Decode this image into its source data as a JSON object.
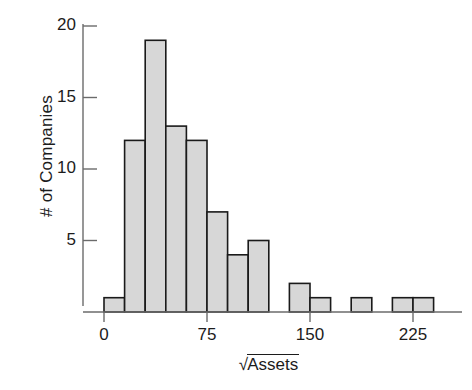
{
  "chart_data": {
    "type": "bar",
    "title": "",
    "subtitle": "",
    "xlabel": "√Assets",
    "xlabel_parts": {
      "radical": "√",
      "radicand": "Assets"
    },
    "ylabel": "# of Companies",
    "xlim": [
      -7.5,
      247.5
    ],
    "ylim": [
      0,
      21
    ],
    "xticks": [
      0,
      75,
      150,
      225
    ],
    "xtick_labels": [
      "0",
      "75",
      "150",
      "225"
    ],
    "yticks": [
      5,
      10,
      15,
      20
    ],
    "ytick_labels": [
      "5",
      "10",
      "15",
      "20"
    ],
    "grid": false,
    "legend": null,
    "bin_width": 15,
    "bin_edges": [
      0,
      15,
      30,
      45,
      60,
      75,
      90,
      105,
      120,
      135,
      150,
      165,
      180,
      195,
      210,
      225,
      240
    ],
    "categories": [
      "0-15",
      "15-30",
      "30-45",
      "45-60",
      "60-75",
      "75-90",
      "90-105",
      "105-120",
      "120-135",
      "135-150",
      "150-165",
      "165-180",
      "180-195",
      "195-210",
      "210-225",
      "225-240"
    ],
    "values": [
      1,
      12,
      19,
      13,
      12,
      7,
      4,
      5,
      0,
      2,
      1,
      0,
      1,
      0,
      1,
      1
    ],
    "bar_fill_color": "#d7d7d7",
    "bar_edge_color": "#1a1a1a",
    "axis_color": "#6b6b6b",
    "background_color": "#ffffff"
  },
  "axes": {
    "y_axis_name": "# of Companies",
    "x_axis_name": "√Assets"
  }
}
